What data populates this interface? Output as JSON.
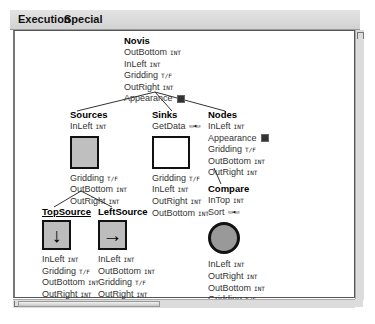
{
  "menubar": {
    "items": [
      "Execution",
      "Special"
    ]
  },
  "canvas": {
    "nodes": {
      "novis": {
        "title": "Novis",
        "props": [
          {
            "name": "OutBottom",
            "tag": "INT"
          },
          {
            "name": "InLeft",
            "tag": "INT"
          },
          {
            "name": "Gridding",
            "tag": "T/F"
          },
          {
            "name": "OutRight",
            "tag": "INT"
          },
          {
            "name": "Appearance",
            "tag": "appearance-icon"
          }
        ]
      },
      "sources": {
        "title": "Sources",
        "props_top": [
          {
            "name": "InLeft",
            "tag": "INT"
          }
        ],
        "props": [
          {
            "name": "Gridding",
            "tag": "T/F"
          },
          {
            "name": "OutBottom",
            "tag": "INT"
          },
          {
            "name": "OutRight",
            "tag": "INT"
          }
        ]
      },
      "sinks": {
        "title": "Sinks",
        "props_top": [
          {
            "name": "GetData",
            "tag": "link-icon"
          }
        ],
        "props": [
          {
            "name": "Gridding",
            "tag": "T/F"
          },
          {
            "name": "InLeft",
            "tag": "INT"
          },
          {
            "name": "OutRight",
            "tag": "INT"
          },
          {
            "name": "OutBottom",
            "tag": "INT"
          }
        ]
      },
      "nodes": {
        "title": "Nodes",
        "props": [
          {
            "name": "InLeft",
            "tag": "INT"
          },
          {
            "name": "Appearance",
            "tag": "appearance-icon"
          },
          {
            "name": "Gridding",
            "tag": "T/F"
          },
          {
            "name": "OutBottom",
            "tag": "INT"
          },
          {
            "name": "OutRight",
            "tag": "INT"
          }
        ]
      },
      "compare": {
        "title": "Compare",
        "props_top": [
          {
            "name": "InTop",
            "tag": "INT"
          },
          {
            "name": "Sort",
            "tag": "link-icon"
          }
        ],
        "props": [
          {
            "name": "InLeft",
            "tag": "INT"
          },
          {
            "name": "OutRight",
            "tag": "INT"
          },
          {
            "name": "OutBottom",
            "tag": "INT"
          },
          {
            "name": "Gridding",
            "tag": "T/F"
          }
        ]
      },
      "topsource": {
        "title": "TopSource",
        "icon": "↓",
        "props": [
          {
            "name": "InLeft",
            "tag": "INT"
          },
          {
            "name": "Gridding",
            "tag": "T/F"
          },
          {
            "name": "OutBottom",
            "tag": "INT"
          },
          {
            "name": "OutRight",
            "tag": "INT"
          }
        ]
      },
      "leftsource": {
        "title": "LeftSource",
        "icon": "→",
        "props": [
          {
            "name": "InLeft",
            "tag": "INT"
          },
          {
            "name": "OutBottom",
            "tag": "INT"
          },
          {
            "name": "Gridding",
            "tag": "T/F"
          },
          {
            "name": "OutRight",
            "tag": "INT"
          }
        ]
      }
    },
    "link_glyph": "▭◂▭"
  },
  "colors": {
    "frame_border": "#555555",
    "box_fill": "#bfbfbf",
    "circle_fill": "#999999"
  }
}
